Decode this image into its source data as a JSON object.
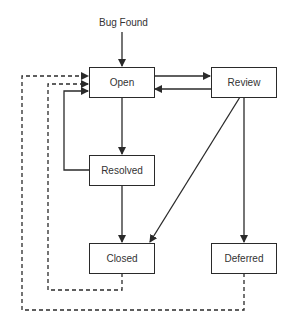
{
  "diagram": {
    "start_label": "Bug Found",
    "nodes": [
      {
        "id": "open",
        "label": "Open"
      },
      {
        "id": "review",
        "label": "Review"
      },
      {
        "id": "resolved",
        "label": "Resolved"
      },
      {
        "id": "closed",
        "label": "Closed"
      },
      {
        "id": "deferred",
        "label": "Deferred"
      }
    ],
    "edges": [
      {
        "from": "start",
        "to": "open",
        "style": "solid"
      },
      {
        "from": "open",
        "to": "review",
        "style": "solid"
      },
      {
        "from": "review",
        "to": "open",
        "style": "solid"
      },
      {
        "from": "open",
        "to": "resolved",
        "style": "solid"
      },
      {
        "from": "resolved",
        "to": "open",
        "style": "solid"
      },
      {
        "from": "resolved",
        "to": "closed",
        "style": "solid"
      },
      {
        "from": "review",
        "to": "closed",
        "style": "solid"
      },
      {
        "from": "review",
        "to": "deferred",
        "style": "solid"
      },
      {
        "from": "closed",
        "to": "open",
        "style": "dashed"
      },
      {
        "from": "deferred",
        "to": "open",
        "style": "dashed"
      }
    ],
    "colors": {
      "line": "#2a2a2a",
      "text": "#333333",
      "background": "#ffffff"
    }
  }
}
